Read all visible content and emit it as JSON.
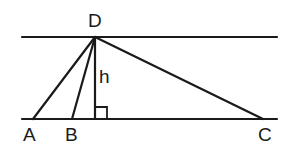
{
  "diagram": {
    "type": "geometry",
    "colors": {
      "stroke": "#1a1a1a",
      "background": "#ffffff"
    },
    "parallel_lines": [
      {
        "name": "top-line",
        "x1": 22,
        "y1": 37,
        "x2": 277,
        "y2": 37
      },
      {
        "name": "bottom-line",
        "x1": 22,
        "y1": 119,
        "x2": 277,
        "y2": 119
      }
    ],
    "points": {
      "D": {
        "x": 95,
        "y": 37,
        "label": "D",
        "label_x": 88,
        "label_y": 27
      },
      "A": {
        "x": 33,
        "y": 119,
        "label": "A",
        "label_x": 23,
        "label_y": 141
      },
      "B": {
        "x": 72,
        "y": 119,
        "label": "B",
        "label_x": 65,
        "label_y": 141
      },
      "C": {
        "x": 263,
        "y": 119,
        "label": "C",
        "label_x": 258,
        "label_y": 141
      },
      "H": {
        "x": 95,
        "y": 119
      }
    },
    "segments": [
      "DA",
      "DB",
      "DC",
      "DH"
    ],
    "altitude": {
      "label": "h",
      "label_x": 99,
      "label_y": 83
    },
    "right_angle_marker": {
      "x": 95,
      "y": 107,
      "size": 12
    }
  }
}
